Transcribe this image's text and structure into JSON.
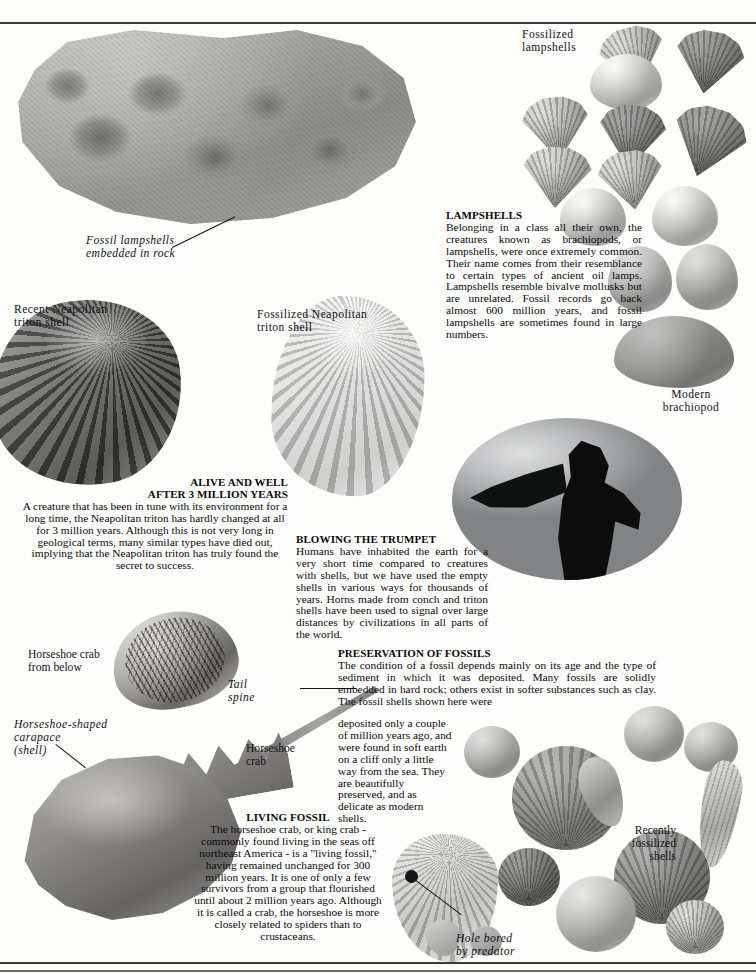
{
  "page": {
    "width": 756,
    "height": 974,
    "background_color": "#fdfdfc",
    "rule_color": "#3a3a3a"
  },
  "captions": {
    "fossil_lampshells_in_rock": "Fossil  lampshells\nembedded  in  rock",
    "fossilized_lampshells": "Fossilized\nlampshells",
    "modern_brachiopod": "Modern\nbrachiopod",
    "recent_neapolitan_triton": "Recent  Neapolitan\ntriton  shell",
    "fossilized_neapolitan_triton": "Fossilized  Neapolitan\ntriton  shell",
    "horseshoe_crab_from_below": "Horseshoe crab\nfrom below",
    "tail_spine": "Tail\nspine",
    "horseshoe_shaped_carapace": "Horseshoe-shaped\ncarapace\n(shell)",
    "horseshoe_crab": "Horseshoe\ncrab",
    "recently_fossilized_shells": "Recently\nfossilized\nshells",
    "hole_bored_by_predator": "Hole  bored\nby  predator"
  },
  "articles": {
    "lampshells": {
      "heading": "LAMPSHELLS",
      "body": "Belonging in a class all their own, the creatures known as brachiopods, or lampshells, were once extremely common. Their name comes from their resemblance to certain types of ancient oil lamps. Lampshells resemble bivalve mollusks but are unrelated. Fossil records go back almost 600 million years, and fossil lampshells are sometimes found in large numbers."
    },
    "alive_and_well": {
      "heading_line1": "ALIVE AND WELL",
      "heading_line2": "AFTER 3 MILLION YEARS",
      "body": "A creature that has been in tune with its environment for a long time, the Neapolitan triton has hardly changed at all for 3 million years. Although this is not very long in geological terms, many similar types have died out, implying that the Neapolitan triton has truly found the secret to success."
    },
    "blowing_the_trumpet": {
      "heading": "BLOWING THE TRUMPET",
      "body": "Humans have inhabited the earth for a very short time compared to creatures with shells, but we have used the empty shells in various ways for thousands of years. Horns made from conch and triton shells have been used to signal over large distances by civilizations in all parts of the world."
    },
    "preservation_of_fossils": {
      "heading": "PRESERVATION OF FOSSILS",
      "body_wide": "The condition of a fossil depends mainly on its age and the type of sediment in which it was deposited. Many fossils are solidly embedded in hard rock; others exist in softer substances such as clay. The fossil shells shown here were",
      "body_narrow": "deposited only a couple of million years ago, and were found in soft earth on a cliff only a little way from the sea. They are beautifully preserved, and as delicate as modern shells."
    },
    "living_fossil": {
      "heading": "LIVING FOSSIL",
      "body": "The horseshoe crab, or king crab - commonly found living in the seas off northeast America - is a \"living fossil,\" having remained unchanged for 300 million years. It is one of only a few survivors from a group that flourished until about 2 million years ago. Although it is called a crab, the horseshoe is more closely related to spiders than to crustaceans."
    }
  }
}
